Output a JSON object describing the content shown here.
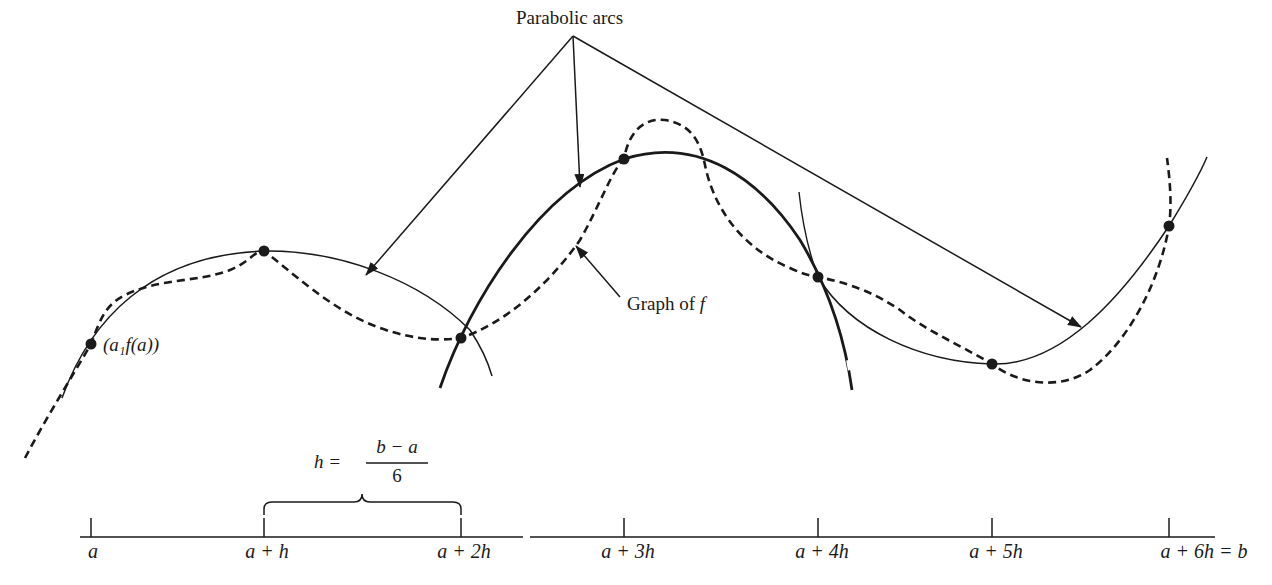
{
  "diagram": {
    "annotations": {
      "parabolic_arcs_label": "Parabolic arcs",
      "graph_label": "Graph of f",
      "graph_label_prefix": "Graph of ",
      "graph_label_var": "f",
      "start_point_label": "(a₁f(a))",
      "h_definition_lhs": "h  =",
      "h_definition_numerator": "b − a",
      "h_definition_denominator": "6"
    },
    "axis": {
      "ticks": [
        {
          "label": "a",
          "x": 91
        },
        {
          "label": "a + h",
          "x": 264
        },
        {
          "label": "a + 2h",
          "x": 461
        },
        {
          "label": "a + 3h",
          "x": 624
        },
        {
          "label": "a + 4h",
          "x": 818
        },
        {
          "label": "a + 5h",
          "x": 992
        },
        {
          "label": "a + 6h = b",
          "x": 1169
        }
      ]
    },
    "points": [
      {
        "name": "P0",
        "x": 91,
        "y": 344
      },
      {
        "name": "P1",
        "x": 264,
        "y": 251
      },
      {
        "name": "P2",
        "x": 461,
        "y": 338
      },
      {
        "name": "P3",
        "x": 624,
        "y": 159
      },
      {
        "name": "P4",
        "x": 818,
        "y": 277
      },
      {
        "name": "P5",
        "x": 992,
        "y": 364
      },
      {
        "name": "P6",
        "x": 1169,
        "y": 226
      }
    ],
    "colors": {
      "ink": "#1a1a1a",
      "background": "#ffffff"
    }
  }
}
